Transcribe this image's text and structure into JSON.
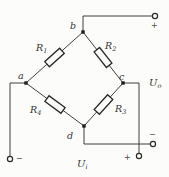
{
  "colors": {
    "background": "#fcfcfa",
    "line": "#2a2a2a",
    "label": "#333333"
  },
  "nodes": {
    "a": "a",
    "b": "b",
    "c": "c",
    "d": "d"
  },
  "resistors": {
    "r1": {
      "base": "R",
      "sub": "1"
    },
    "r2": {
      "base": "R",
      "sub": "2"
    },
    "r3": {
      "base": "R",
      "sub": "3"
    },
    "r4": {
      "base": "R",
      "sub": "4"
    }
  },
  "voltages": {
    "output": {
      "base": "U",
      "sub": "o"
    },
    "input": {
      "base": "U",
      "sub": "i"
    }
  },
  "polarity": {
    "output_plus": "+",
    "output_minus": "−",
    "input_plus": "+",
    "input_minus": "−"
  }
}
